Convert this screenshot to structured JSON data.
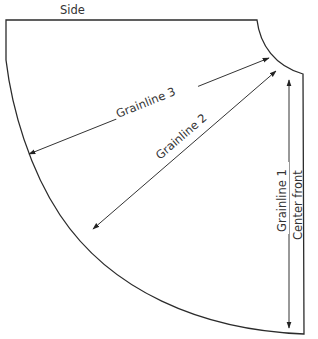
{
  "diagram": {
    "labels": {
      "side": "Side",
      "grainline_3": "Grainline 3",
      "grainline_2": "Grainline 2",
      "grainline_1": "Grainline 1",
      "center_front": "Center front"
    },
    "colors": {
      "outline": "#2b2b2b",
      "grainline": "#333333",
      "text": "#333333",
      "background": "#ffffff"
    }
  }
}
